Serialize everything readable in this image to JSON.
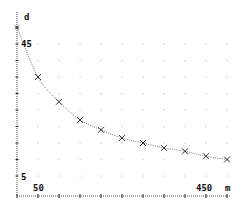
{
  "chart_data": {
    "type": "scatter",
    "title": "",
    "xlabel": "m",
    "ylabel": "d",
    "x_tick_labels": [
      {
        "value": 50,
        "label": "50"
      },
      {
        "value": 450,
        "label": "450"
      }
    ],
    "y_tick_labels": [
      {
        "value": 45,
        "label": "45"
      },
      {
        "value": 5,
        "label": "5"
      }
    ],
    "xlim": [
      0,
      500
    ],
    "ylim": [
      5,
      50
    ],
    "x_tick_step": 50,
    "y_tick_step": 5,
    "grid": "dotted",
    "legend": null,
    "marker": "x",
    "trend_line": "dotted curve through points",
    "series": [
      {
        "name": "d vs m",
        "x": [
          0,
          50,
          100,
          150,
          200,
          250,
          300,
          350,
          400,
          450,
          500
        ],
        "y": [
          50,
          35,
          27.5,
          22,
          19,
          16.5,
          15,
          13.5,
          12.5,
          11,
          10
        ]
      }
    ]
  },
  "labels": {
    "y_axis_name": "d",
    "x_axis_name": "m",
    "y_top_tick": "45",
    "y_bottom_tick": "5",
    "x_left_tick": "50",
    "x_right_tick": "450"
  },
  "colors": {
    "axis": "#222222",
    "marker": "#333333",
    "curve": "#555555",
    "grid": "#c8c8c8",
    "background": "#ffffff"
  }
}
